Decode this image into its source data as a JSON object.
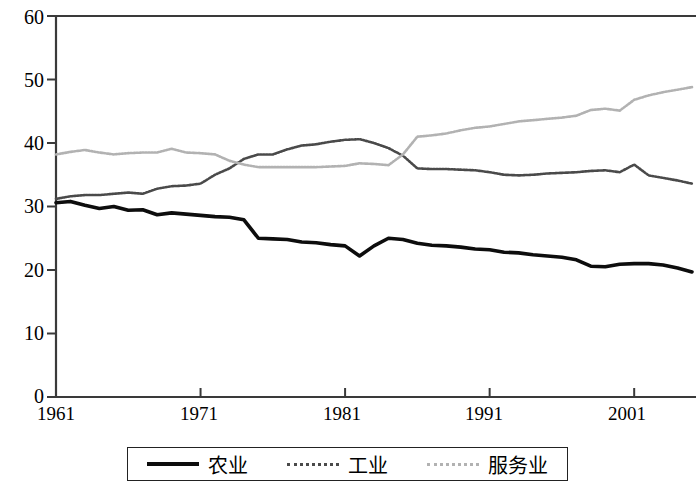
{
  "chart_data": {
    "type": "line",
    "title": "",
    "subtitle": "",
    "xlabel": "",
    "ylabel": "",
    "xlim": [
      1961,
      2005
    ],
    "ylim": [
      0,
      60
    ],
    "grid": false,
    "legend_position": "bottom",
    "y_ticks": [
      "60",
      "50",
      "40",
      "30",
      "20",
      "10",
      "0"
    ],
    "y_tick_values": [
      60,
      50,
      40,
      30,
      20,
      10,
      0
    ],
    "x_ticks": [
      "1961",
      "1971",
      "1981",
      "1991",
      "2001"
    ],
    "x_tick_values": [
      1961,
      1971,
      1981,
      1991,
      2001
    ],
    "x": [
      1961,
      1962,
      1963,
      1964,
      1965,
      1966,
      1967,
      1968,
      1969,
      1970,
      1971,
      1972,
      1973,
      1974,
      1975,
      1976,
      1977,
      1978,
      1979,
      1980,
      1981,
      1982,
      1983,
      1984,
      1985,
      1986,
      1987,
      1988,
      1989,
      1990,
      1991,
      1992,
      1993,
      1994,
      1995,
      1996,
      1997,
      1998,
      1999,
      2000,
      2001,
      2002,
      2003,
      2004,
      2005
    ],
    "series": [
      {
        "name": "农业",
        "color": "#0d0d0d",
        "style": "solid",
        "width": 3.6,
        "values": [
          30.6,
          30.8,
          30.2,
          29.7,
          30.0,
          29.4,
          29.5,
          28.7,
          29.0,
          28.8,
          28.6,
          28.4,
          28.3,
          27.9,
          25.0,
          24.9,
          24.8,
          24.4,
          24.3,
          24.0,
          23.8,
          22.2,
          23.8,
          25.0,
          24.8,
          24.2,
          23.9,
          23.8,
          23.6,
          23.3,
          23.2,
          22.8,
          22.7,
          22.4,
          22.2,
          22.0,
          21.6,
          20.6,
          20.5,
          20.9,
          21.0,
          21.0,
          20.8,
          20.3,
          19.7
        ]
      },
      {
        "name": "工业",
        "color": "#4a4a4a",
        "style": "dotted",
        "width": 2.6,
        "values": [
          31.2,
          31.6,
          31.8,
          31.8,
          32.0,
          32.2,
          32.0,
          32.8,
          33.2,
          33.3,
          33.6,
          35.0,
          36.0,
          37.5,
          38.2,
          38.2,
          39.0,
          39.6,
          39.8,
          40.2,
          40.5,
          40.6,
          40.0,
          39.2,
          38.0,
          36.0,
          35.9,
          35.9,
          35.8,
          35.7,
          35.4,
          35.0,
          34.9,
          35.0,
          35.2,
          35.3,
          35.4,
          35.6,
          35.7,
          35.4,
          36.6,
          34.9,
          34.5,
          34.1,
          33.6
        ]
      },
      {
        "name": "服务业",
        "color": "#b2b2b2",
        "style": "dotted",
        "width": 2.6,
        "values": [
          38.2,
          38.6,
          38.9,
          38.5,
          38.2,
          38.4,
          38.5,
          38.5,
          39.1,
          38.5,
          38.4,
          38.2,
          37.2,
          36.6,
          36.2,
          36.2,
          36.2,
          36.2,
          36.2,
          36.3,
          36.4,
          36.8,
          36.7,
          36.5,
          38.2,
          41.0,
          41.2,
          41.5,
          42.0,
          42.4,
          42.6,
          43.0,
          43.4,
          43.6,
          43.8,
          44.0,
          44.3,
          45.2,
          45.4,
          45.1,
          46.8,
          47.5,
          48.0,
          48.4,
          48.8
        ]
      }
    ]
  },
  "axes": {
    "y_labels": [
      {
        "text": "60",
        "top": 7
      },
      {
        "text": "50",
        "top": 70
      },
      {
        "text": "40",
        "top": 133
      },
      {
        "text": "30",
        "top": 196
      },
      {
        "text": "20",
        "top": 260
      },
      {
        "text": "10",
        "top": 323
      },
      {
        "text": "0",
        "top": 386
      }
    ],
    "x_labels": [
      {
        "text": "1961",
        "left": 56
      },
      {
        "text": "1971",
        "left": 199
      },
      {
        "text": "1981",
        "left": 342
      },
      {
        "text": "1991",
        "left": 484
      },
      {
        "text": "2001",
        "left": 627
      }
    ]
  },
  "legend": {
    "items": [
      {
        "label": "农业",
        "swatch": "s-ag",
        "icon": "line-swatch-solid-black"
      },
      {
        "label": "工业",
        "swatch": "s-ind",
        "icon": "line-swatch-dotted-darkgray"
      },
      {
        "label": "服务业",
        "swatch": "s-serv",
        "icon": "line-swatch-dotted-lightgray"
      }
    ]
  },
  "colors": {
    "agriculture": "#0d0d0d",
    "industry": "#4a4a4a",
    "services": "#b2b2b2",
    "axis": "#3a3a3a",
    "background": "#ffffff"
  }
}
